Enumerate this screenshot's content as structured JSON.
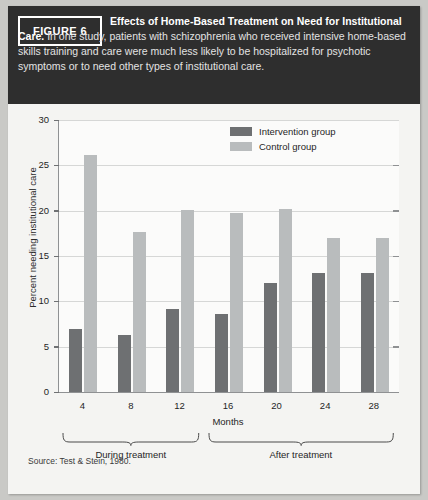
{
  "figure": {
    "badge_label": "FIGURE 6",
    "caption_bold": "Effects of Home-Based Treatment on Need for Institutional Care.",
    "caption_rest": " In one study, patients with schizophrenia who received intensive home-based skills training and care were much less likely to be hospitalized for psychotic symptoms or to need other types of institutional care.",
    "source": "Source: Test & Stein, 1980."
  },
  "colors": {
    "header_background": "#2e2e2e",
    "card_background": "#f4f4f2",
    "intervention": "#6e7072",
    "control": "#b9bcbd",
    "axis": "#8f9193",
    "gridline": "#d6d7d6"
  },
  "legend": {
    "position": "top-right",
    "entries": [
      {
        "label": "Intervention group",
        "color": "#6e7072"
      },
      {
        "label": "Control group",
        "color": "#b9bcbd"
      }
    ]
  },
  "annotations": [
    {
      "label": "During treatment",
      "spans": [
        "4",
        "8",
        "12"
      ]
    },
    {
      "label": "After treatment",
      "spans": [
        "16",
        "20",
        "24",
        "28"
      ]
    }
  ],
  "chart_data": {
    "type": "bar",
    "title": "Effects of Home-Based Treatment on Need for Institutional Care",
    "xlabel": "Months",
    "ylabel": "Percent needing institutional care",
    "categories": [
      "4",
      "8",
      "12",
      "16",
      "20",
      "24",
      "28"
    ],
    "ylim": [
      0,
      30
    ],
    "yticks": [
      0,
      5,
      10,
      15,
      20,
      25,
      30
    ],
    "grid": true,
    "series": [
      {
        "name": "Intervention group",
        "color": "#6e7072",
        "values": [
          7.0,
          6.3,
          9.2,
          8.6,
          12.0,
          13.1,
          13.1
        ]
      },
      {
        "name": "Control group",
        "color": "#b9bcbd",
        "values": [
          26.1,
          17.6,
          20.1,
          19.7,
          20.2,
          17.0,
          17.0
        ]
      }
    ]
  }
}
